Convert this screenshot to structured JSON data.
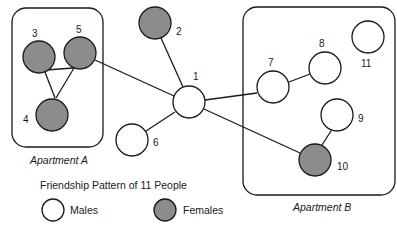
{
  "diagram": {
    "title": "Friendship Pattern of 11 People",
    "groups": [
      {
        "label": "Apartment A",
        "members": [
          "3",
          "4",
          "5"
        ]
      },
      {
        "label": "Apartment B",
        "members": [
          "7",
          "8",
          "9",
          "10",
          "11"
        ]
      }
    ],
    "nodes": [
      {
        "id": "1",
        "gender": "male"
      },
      {
        "id": "2",
        "gender": "female"
      },
      {
        "id": "3",
        "gender": "female"
      },
      {
        "id": "4",
        "gender": "female"
      },
      {
        "id": "5",
        "gender": "female"
      },
      {
        "id": "6",
        "gender": "male"
      },
      {
        "id": "7",
        "gender": "male"
      },
      {
        "id": "8",
        "gender": "male"
      },
      {
        "id": "9",
        "gender": "male"
      },
      {
        "id": "10",
        "gender": "female"
      },
      {
        "id": "11",
        "gender": "male"
      }
    ],
    "edges": [
      [
        "3",
        "5"
      ],
      [
        "3",
        "4"
      ],
      [
        "5",
        "4"
      ],
      [
        "5",
        "1"
      ],
      [
        "2",
        "1"
      ],
      [
        "6",
        "1"
      ],
      [
        "1",
        "7"
      ],
      [
        "1",
        "10"
      ],
      [
        "7",
        "8"
      ],
      [
        "9",
        "10"
      ]
    ],
    "legend": [
      {
        "label": "Males",
        "fill": "#ffffff"
      },
      {
        "label": "Females",
        "fill": "#8c8c8c"
      }
    ]
  }
}
